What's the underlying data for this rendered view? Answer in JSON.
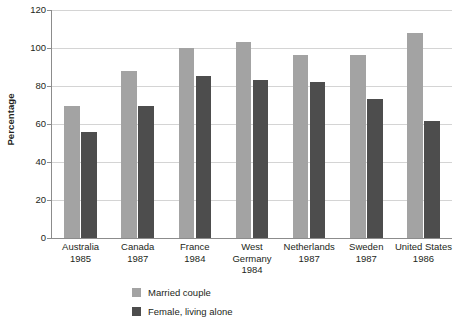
{
  "chart_data": {
    "type": "bar",
    "title": "",
    "subtitle": "",
    "xlabel": "",
    "ylabel": "Percentage",
    "ylim": [
      0,
      120
    ],
    "ytick_step": 20,
    "yticks": [
      0,
      20,
      40,
      60,
      80,
      100,
      120
    ],
    "ytick_labels": [
      "0",
      "20",
      "40",
      "60",
      "80",
      "100",
      "120"
    ],
    "grid": true,
    "grid_axis": "y",
    "legend_position": "bottom-left",
    "categories": [
      "Australia 1985",
      "Canada 1987",
      "France 1984",
      "West Germany 1984",
      "Netherlands 1987",
      "Sweden 1987",
      "United States 1986"
    ],
    "category_lines": [
      [
        "Australia",
        "1985"
      ],
      [
        "Canada",
        "1987"
      ],
      [
        "France",
        "1984"
      ],
      [
        "West",
        "Germany",
        "1984"
      ],
      [
        "Netherlands",
        "1987"
      ],
      [
        "Sweden",
        "1987"
      ],
      [
        "United States",
        "1986"
      ]
    ],
    "series": [
      {
        "name": "Married couple",
        "color": "#a3a3a3",
        "values": [
          69.5,
          88,
          100,
          103,
          96.5,
          96.5,
          108
        ]
      },
      {
        "name": "Female, living alone",
        "color": "#4d4d4d",
        "values": [
          56,
          69.5,
          85.5,
          83,
          82,
          73,
          61.5
        ]
      }
    ]
  },
  "axis": {
    "y_title": "Percentage"
  },
  "colors": {
    "series_0": "#a3a3a3",
    "series_1": "#4d4d4d",
    "gridline": "#d4d4d4",
    "axis_line": "#8c8c8c",
    "text": "#231f20",
    "background": "#ffffff"
  }
}
